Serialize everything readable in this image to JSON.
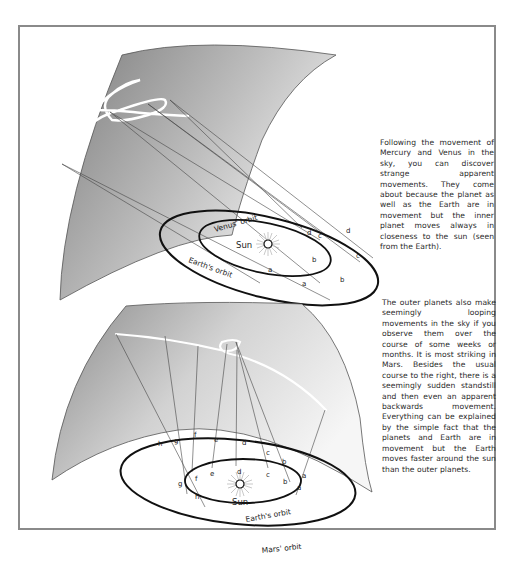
{
  "figure_top": {
    "caption": "Following the movement of Mercury and Venus in the sky, you can discover strange apparent movements. They come about because the planet as well as the Earth are in movement but the inner planet moves always in closeness to the sun (seen from the Earth).",
    "labels": {
      "sun": "Sun",
      "inner_orbit": "Venus' orbit",
      "outer_orbit": "Earth's orbit",
      "inner_points": [
        "a",
        "b",
        "c",
        "d"
      ],
      "outer_points": [
        "a",
        "b",
        "c",
        "d"
      ]
    }
  },
  "figure_bottom": {
    "caption": "The outer planets also make seemingly looping movements in the sky if you observe them over the course of some weeks or months. It is most striking in Mars. Besides the usual course to the right, there is a seemingly sudden standstill and then even an apparent backwards movement. Everything can be explained by the simple fact that the planets and Earth are in movement but the Earth moves faster around the sun than the outer planets.",
    "labels": {
      "sun": "Sun",
      "inner_orbit": "Earth's orbit",
      "outer_orbit": "Mars' orbit",
      "inner_points": [
        "a",
        "b",
        "c",
        "d",
        "e",
        "f",
        "g",
        "h"
      ],
      "outer_points": [
        "a",
        "b",
        "c",
        "d",
        "e",
        "f",
        "g",
        "h"
      ]
    }
  },
  "colors": {
    "frame": "#8a8a8a",
    "sky_dark": "#8c8c8c",
    "sky_light": "#f2f2f2",
    "orbit": "#111111",
    "text": "#2a2a2a"
  }
}
